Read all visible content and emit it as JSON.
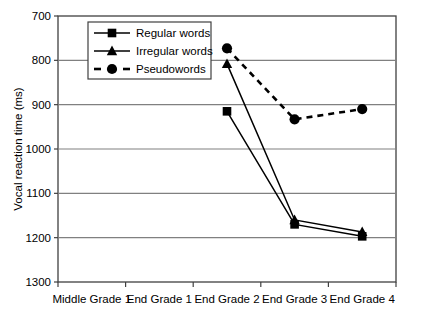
{
  "chart_data": {
    "type": "line",
    "title": "",
    "xlabel": "",
    "ylabel": "Vocal reaction time (ms)",
    "categories": [
      "Middle Grade 1",
      "End Grade 1",
      "End Grade 2",
      "End Grade 3",
      "End Grade 4"
    ],
    "ylim": [
      700,
      1300
    ],
    "yticks": [
      700,
      800,
      900,
      1000,
      1100,
      1200,
      1300
    ],
    "ytick_labels": [
      "700",
      "800",
      "900",
      "1000",
      "1100",
      "1200",
      "1300"
    ],
    "grid": "horizontal",
    "legend_position": "upper-left-inside",
    "series": [
      {
        "name": "Regular words",
        "marker": "square",
        "line_style": "solid",
        "color": "#000000",
        "values": [
          null,
          null,
          1085,
          830,
          803
        ]
      },
      {
        "name": "Irregular words",
        "marker": "triangle",
        "line_style": "solid",
        "color": "#000000",
        "values": [
          null,
          null,
          1192,
          840,
          813
        ]
      },
      {
        "name": "Pseudowords",
        "marker": "circle",
        "line_style": "dashed",
        "color": "#000000",
        "values": [
          null,
          null,
          1227,
          1067,
          1090
        ]
      }
    ]
  },
  "axes": {
    "y_title": "Vocal reaction time (ms)",
    "y_ticks": [
      {
        "label": "1300"
      },
      {
        "label": "1200"
      },
      {
        "label": "1100"
      },
      {
        "label": "1000"
      },
      {
        "label": "900"
      },
      {
        "label": "800"
      },
      {
        "label": "700"
      }
    ],
    "x_ticks": [
      {
        "label": "Middle Grade 1"
      },
      {
        "label": "End Grade 1"
      },
      {
        "label": "End Grade 2"
      },
      {
        "label": "End Grade 3"
      },
      {
        "label": "End Grade 4"
      }
    ]
  },
  "legend": {
    "items": [
      {
        "label": "Regular words",
        "marker": "square-marker-icon",
        "line_style": "solid"
      },
      {
        "label": "Irregular words",
        "marker": "triangle-marker-icon",
        "line_style": "solid"
      },
      {
        "label": "Pseudowords",
        "marker": "circle-marker-icon",
        "line_style": "dashed"
      }
    ]
  },
  "colors": {
    "series": "#000000",
    "grid": "#808080",
    "axis": "#404040",
    "background": "#ffffff"
  }
}
